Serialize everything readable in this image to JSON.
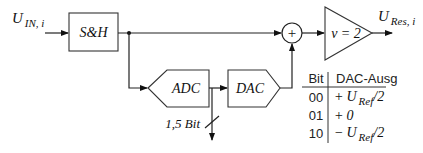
{
  "diagram": {
    "input_label": {
      "main": "U",
      "sub": "IN, i"
    },
    "output_label": {
      "main": "U",
      "sub": "Res, i"
    },
    "blocks": {
      "sample_hold": "S&H",
      "adc": "ADC",
      "dac": "DAC",
      "summer": "+",
      "amplifier": "v = 2"
    },
    "bus_label": "1,5 Bit",
    "table": {
      "headers": [
        "Bit",
        "DAC-Ausg"
      ],
      "rows": [
        {
          "bit": "00",
          "sign": "+",
          "value_main": "U",
          "value_sub": "Ref",
          "value_tail": "/2"
        },
        {
          "bit": "01",
          "sign": "+",
          "value_main": "0",
          "value_sub": "",
          "value_tail": ""
        },
        {
          "bit": "10",
          "sign": "−",
          "value_main": "U",
          "value_sub": "Ref",
          "value_tail": "/2"
        }
      ]
    }
  }
}
